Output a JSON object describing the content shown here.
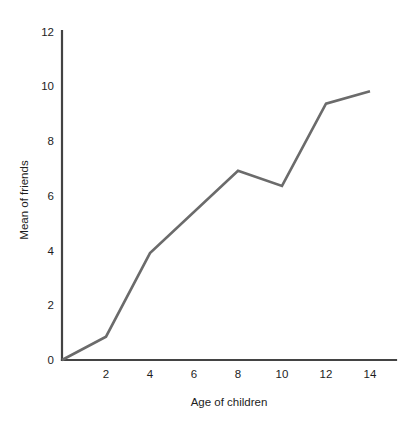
{
  "chart_data": {
    "type": "line",
    "title": "",
    "xlabel": "Age of children",
    "ylabel": "Mean of friends",
    "x": [
      0,
      2,
      4,
      8,
      10,
      12,
      14
    ],
    "values": [
      0,
      0.85,
      3.9,
      6.9,
      6.35,
      9.35,
      9.8
    ],
    "series": [
      {
        "name": "Mean of friends",
        "x": [
          0,
          2,
          4,
          8,
          10,
          12,
          14
        ],
        "values": [
          0,
          0.85,
          3.9,
          6.9,
          6.35,
          9.35,
          9.8
        ]
      }
    ],
    "xlim": [
      0,
      15.7
    ],
    "ylim": [
      0,
      12
    ],
    "xticks": [
      2,
      4,
      6,
      8,
      10,
      12,
      14
    ],
    "xtick_labels": [
      "2",
      "4",
      "6",
      "8",
      "10",
      "12",
      "14"
    ],
    "yticks": [
      0,
      2,
      4,
      6,
      8,
      10,
      12
    ],
    "ytick_labels": [
      "0",
      "2",
      "4",
      "6",
      "8",
      "10",
      "12"
    ],
    "grid": false,
    "legend": "none",
    "line_color": "#6b6b6b",
    "axis_color": "#434343",
    "background_color": "#ffffff"
  },
  "labels": {
    "y_axis_title": "Mean of friends",
    "x_axis_title": "Age of children"
  }
}
